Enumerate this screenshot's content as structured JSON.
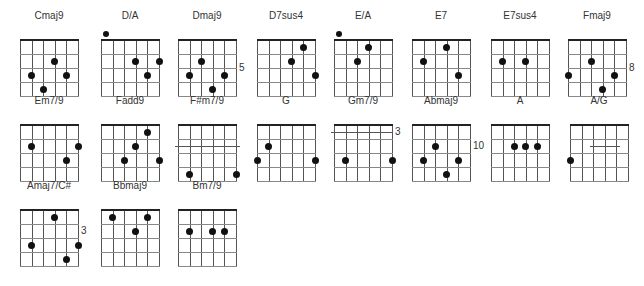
{
  "grid": {
    "width": 58,
    "height": 56,
    "strings": 6,
    "frets": 4
  },
  "chords": [
    {
      "name": "Cmaj9",
      "x": 20,
      "y": 40,
      "dots": [
        [
          3,
          1
        ],
        [
          1,
          2
        ],
        [
          4,
          2
        ],
        [
          2,
          3
        ]
      ],
      "open": [],
      "fret_label": "",
      "barre": null
    },
    {
      "name": "D/A",
      "x": 101,
      "y": 40,
      "dots": [
        [
          3,
          1
        ],
        [
          5,
          1
        ],
        [
          4,
          2
        ]
      ],
      "open": [
        1
      ],
      "fret_label": "",
      "barre": null
    },
    {
      "name": "Dmaj9",
      "x": 178,
      "y": 40,
      "dots": [
        [
          2,
          1
        ],
        [
          1,
          2
        ],
        [
          4,
          2
        ],
        [
          3,
          3
        ]
      ],
      "open": [],
      "fret_label": "5",
      "barre": null
    },
    {
      "name": "D7sus4",
      "x": 257,
      "y": 40,
      "dots": [
        [
          4,
          0
        ],
        [
          3,
          1
        ],
        [
          5,
          2
        ]
      ],
      "open": [],
      "fret_label": "",
      "barre": null
    },
    {
      "name": "E/A",
      "x": 334,
      "y": 40,
      "dots": [
        [
          3,
          0
        ],
        [
          2,
          1
        ]
      ],
      "open": [
        1
      ],
      "fret_label": "",
      "barre": null
    },
    {
      "name": "E7",
      "x": 412,
      "y": 40,
      "dots": [
        [
          3,
          0
        ],
        [
          1,
          1
        ],
        [
          4,
          2
        ]
      ],
      "open": [],
      "fret_label": "",
      "barre": null
    },
    {
      "name": "E7sus4",
      "x": 491,
      "y": 40,
      "dots": [
        [
          1,
          1
        ],
        [
          3,
          1
        ]
      ],
      "open": [],
      "fret_label": "",
      "barre": null
    },
    {
      "name": "Fmaj9",
      "x": 568,
      "y": 40,
      "dots": [
        [
          2,
          1
        ],
        [
          0,
          2
        ],
        [
          4,
          2
        ],
        [
          3,
          3
        ]
      ],
      "open": [],
      "fret_label": "8",
      "barre": null
    },
    {
      "name": "Em7/9",
      "x": 20,
      "y": 125,
      "dots": [
        [
          1,
          1
        ],
        [
          5,
          1
        ],
        [
          4,
          2
        ]
      ],
      "open": [],
      "fret_label": "",
      "barre": null
    },
    {
      "name": "Fadd9",
      "x": 101,
      "y": 125,
      "dots": [
        [
          4,
          0
        ],
        [
          3,
          1
        ],
        [
          2,
          2
        ],
        [
          5,
          2
        ]
      ],
      "open": [],
      "fret_label": "",
      "barre": null
    },
    {
      "name": "F#m7/9",
      "x": 178,
      "y": 125,
      "dots": [
        [
          1,
          3
        ],
        [
          5,
          3
        ]
      ],
      "open": [],
      "fret_label": "",
      "barre": {
        "fret": 1.5,
        "from": -0.3,
        "to": 5.3
      }
    },
    {
      "name": "G",
      "x": 257,
      "y": 125,
      "dots": [
        [
          1,
          1
        ],
        [
          0,
          2
        ],
        [
          5,
          2
        ]
      ],
      "open": [],
      "fret_label": "",
      "barre": null
    },
    {
      "name": "Gm7/9",
      "x": 334,
      "y": 125,
      "dots": [
        [
          1,
          2
        ],
        [
          5,
          2
        ]
      ],
      "open": [],
      "fret_label": "3",
      "barre": {
        "fret": 0.5,
        "from": -0.3,
        "to": 5
      }
    },
    {
      "name": "Abmaj9",
      "x": 412,
      "y": 125,
      "dots": [
        [
          2,
          1
        ],
        [
          1,
          2
        ],
        [
          4,
          2
        ],
        [
          3,
          3
        ]
      ],
      "open": [],
      "fret_label": "10",
      "barre": null
    },
    {
      "name": "A",
      "x": 491,
      "y": 125,
      "dots": [
        [
          2,
          1
        ],
        [
          3,
          1
        ],
        [
          4,
          1
        ]
      ],
      "open": [],
      "fret_label": "",
      "barre": null
    },
    {
      "name": "A/G",
      "x": 570,
      "y": 125,
      "dots": [
        [
          0,
          2
        ]
      ],
      "open": [],
      "fret_label": "",
      "barre": {
        "fret": 1.5,
        "from": 1.7,
        "to": 4.3
      }
    },
    {
      "name": "Amaj7/C#",
      "x": 20,
      "y": 210,
      "dots": [
        [
          3,
          0
        ],
        [
          1,
          2
        ],
        [
          5,
          2
        ],
        [
          4,
          3
        ]
      ],
      "open": [],
      "fret_label": "3",
      "barre": null
    },
    {
      "name": "Bbmaj9",
      "x": 101,
      "y": 210,
      "dots": [
        [
          1,
          0
        ],
        [
          4,
          0
        ],
        [
          3,
          1
        ]
      ],
      "open": [],
      "fret_label": "",
      "barre": null
    },
    {
      "name": "Bm7/9",
      "x": 178,
      "y": 210,
      "dots": [
        [
          1,
          1
        ],
        [
          3,
          1
        ],
        [
          4,
          1
        ]
      ],
      "open": [],
      "fret_label": "",
      "barre": null
    }
  ]
}
